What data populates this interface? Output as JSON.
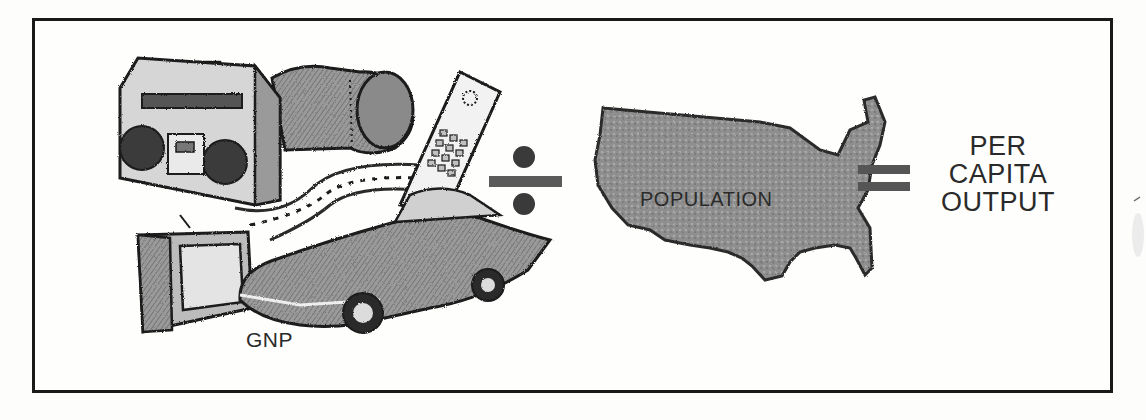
{
  "figure": {
    "title": "",
    "equation": {
      "numerator_label": "GNP",
      "operator_divide": "÷",
      "denominator_label": "POPULATION",
      "operator_equals": "=",
      "result_lines": [
        "PER",
        "CAPITA",
        "OUTPUT"
      ]
    },
    "illustrations": [
      {
        "name": "boombox",
        "icon": "radio-icon"
      },
      {
        "name": "sleeping-bag",
        "icon": "bag-icon"
      },
      {
        "name": "cordless-phone",
        "icon": "phone-icon"
      },
      {
        "name": "road",
        "icon": "road-icon"
      },
      {
        "name": "television",
        "icon": "tv-icon"
      },
      {
        "name": "sports-car",
        "icon": "car-icon"
      },
      {
        "name": "united-states-map",
        "icon": "map-icon"
      }
    ],
    "colors": {
      "ink": "#1a1a1a",
      "shade": "#7a7a7a",
      "map_fill": "#8c8c8c",
      "paper": "#fefefc"
    }
  }
}
